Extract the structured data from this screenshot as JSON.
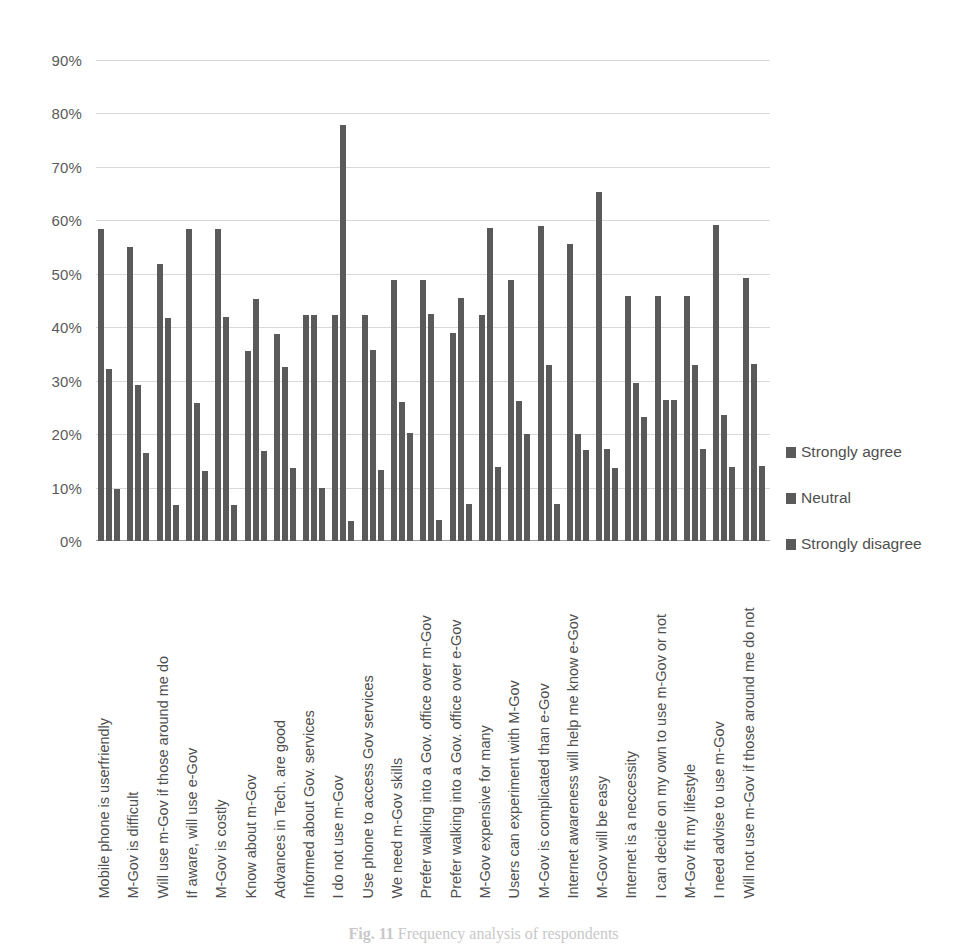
{
  "chart_data": {
    "type": "bar",
    "title": "",
    "subtitle": "",
    "xlabel": "",
    "ylabel": "",
    "ylim": [
      0,
      90
    ],
    "ytick_values": [
      0,
      10,
      20,
      30,
      40,
      50,
      60,
      70,
      80,
      90
    ],
    "ytick_labels": [
      "0%",
      "10%",
      "20%",
      "30%",
      "40%",
      "50%",
      "60%",
      "70%",
      "80%",
      "90%"
    ],
    "grid": true,
    "legend_position": "right",
    "bar_color": "#5a5a5a",
    "categories": [
      "Mobile phone is userfriendly",
      "M-Gov is difficult",
      "Will use m-Gov if those around me do",
      "If aware, will use e-Gov",
      "M-Gov is costly",
      "Know about m-Gov",
      "Advances in Tech. are good",
      "Informed about Gov. services",
      "I do not use m-Gov",
      "Use phone to access Gov services",
      "We need m-Gov skills",
      "Prefer walking into a Gov. office over m-Gov",
      "Prefer walking into a Gov. office over e-Gov",
      "M-Gov expensive for many",
      "Users can experiment with M-Gov",
      "M-Gov is complicated than e-Gov",
      "Internet awareness will help me know e-Gov",
      "M-Gov will be easy",
      "Internet is a neccessity",
      "I can decide on my own to use m-Gov or not",
      "M-Gov fit my lifestyle",
      "I need advise to use m-Gov",
      "Will not use m-Gov if those around me do not"
    ],
    "series": [
      {
        "name": "Strongly agree",
        "values": [
          58.3,
          55.1,
          51.8,
          58.4,
          58.4,
          35.6,
          38.8,
          42.2,
          42.2,
          42.2,
          48.9,
          48.9,
          38.9,
          42.3,
          48.9,
          58.9,
          55.5,
          65.3,
          45.8,
          45.8,
          45.8,
          59.1,
          49.3
        ]
      },
      {
        "name": "Neutral",
        "values": [
          32.2,
          29.1,
          41.8,
          25.9,
          42.0,
          45.3,
          32.5,
          42.2,
          77.8,
          35.8,
          26.1,
          42.4,
          45.4,
          58.6,
          26.2,
          32.9,
          20.1,
          17.2,
          29.6,
          26.4,
          33.0,
          23.5,
          33.1
        ]
      },
      {
        "name": "Strongly disagree",
        "values": [
          9.8,
          16.4,
          6.7,
          13.1,
          6.8,
          16.8,
          13.6,
          10.0,
          3.8,
          13.3,
          20.2,
          4.0,
          6.9,
          13.8,
          20.0,
          6.9,
          17.0,
          13.6,
          23.2,
          26.3,
          17.3,
          13.9,
          14.0
        ]
      }
    ]
  },
  "legend": {
    "items": [
      {
        "label": "Strongly agree",
        "color": "#5a5a5a"
      },
      {
        "label": "Neutral",
        "color": "#5a5a5a"
      },
      {
        "label": "Strongly disagree",
        "color": "#5a5a5a"
      }
    ]
  },
  "caption": {
    "figure_number": "Fig. 11",
    "text": "Frequency analysis of respondents"
  }
}
